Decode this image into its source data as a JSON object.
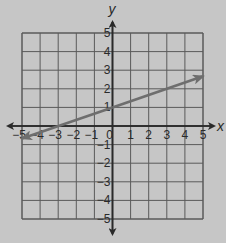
{
  "chart_data": {
    "type": "line",
    "title": "",
    "xlabel": "x",
    "ylabel": "y",
    "xlim": [
      -5,
      5
    ],
    "ylim": [
      -5,
      5
    ],
    "grid": true,
    "x_ticks": [
      -5,
      -4,
      -3,
      -2,
      -1,
      0,
      1,
      2,
      3,
      4,
      5
    ],
    "y_ticks": [
      -5,
      -4,
      -3,
      -2,
      -1,
      1,
      2,
      3,
      4,
      5
    ],
    "series": [
      {
        "name": "line",
        "equation": "y = x/3 + 1",
        "x": [
          -5,
          -3,
          0,
          3,
          5
        ],
        "y": [
          -0.67,
          0,
          1,
          2,
          2.67
        ],
        "arrows": "both",
        "color": "#6e6e6e"
      }
    ]
  },
  "colors": {
    "background": "#c6c6c6",
    "grid": "#5a5a5a",
    "axis": "#2a2a2a",
    "line": "#6e6e6e"
  }
}
